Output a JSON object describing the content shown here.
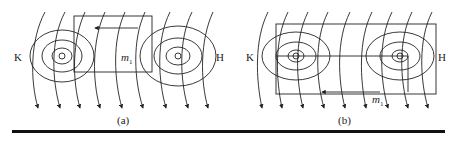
{
  "figure": {
    "panels": [
      {
        "id": "a",
        "caption": "(a)",
        "left_label": "K",
        "right_label": "H",
        "loop_label": "m",
        "loop_label_sub": "1"
      },
      {
        "id": "b",
        "caption": "(b)",
        "left_label": "K",
        "right_label": "H",
        "loop_label": "m",
        "loop_label_sub": "1"
      }
    ],
    "colors": {
      "line": "#222222",
      "rule": "#111111",
      "background": "#ffffff"
    }
  }
}
